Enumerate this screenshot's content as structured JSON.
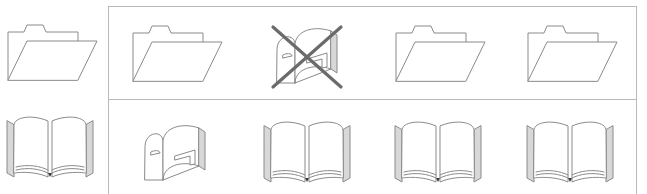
{
  "figure": {
    "name": "icon-analogy-matrix",
    "rows": 2,
    "columns": 4,
    "colors": {
      "icon_stroke": "#8a8a8a",
      "icon_shade": "#d8d8d8",
      "icon_fill": "#ffffff",
      "cross_out_stroke": "#6b6b6b",
      "grid_border": "#b9b9b9",
      "background": "#ffffff"
    }
  },
  "reference_column": {
    "name": "reference-column",
    "cells": [
      {
        "row": 1,
        "icon": "folder-icon",
        "label": "folder",
        "crossed_out": false
      },
      {
        "row": 2,
        "icon": "open-book-icon",
        "label": "open book",
        "crossed_out": false
      }
    ]
  },
  "answer_grid": {
    "name": "answer-grid",
    "rows": [
      {
        "row": 1,
        "cells": [
          {
            "column": 1,
            "icon": "folder-icon",
            "label": "folder",
            "crossed_out": false
          },
          {
            "column": 2,
            "icon": "mailbox-icon",
            "label": "mailbox",
            "crossed_out": true
          },
          {
            "column": 3,
            "icon": "folder-icon",
            "label": "folder",
            "crossed_out": false
          },
          {
            "column": 4,
            "icon": "folder-icon",
            "label": "folder",
            "crossed_out": false
          }
        ]
      },
      {
        "row": 2,
        "cells": [
          {
            "column": 1,
            "icon": "mailbox-icon",
            "label": "mailbox",
            "crossed_out": false
          },
          {
            "column": 2,
            "icon": "open-book-icon",
            "label": "open book",
            "crossed_out": false
          },
          {
            "column": 3,
            "icon": "open-book-icon",
            "label": "open book",
            "crossed_out": false
          },
          {
            "column": 4,
            "icon": "open-book-icon",
            "label": "open book",
            "crossed_out": false
          }
        ]
      }
    ]
  }
}
